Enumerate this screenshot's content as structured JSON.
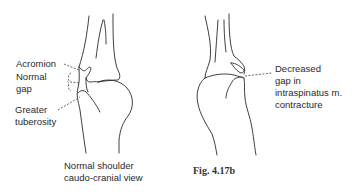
{
  "figure": {
    "left_panel": {
      "labels": {
        "acromion": "Acromion",
        "normal_gap_line1": "Normal",
        "normal_gap_line2": "gap",
        "greater_tuberosity_line1": "Greater",
        "greater_tuberosity_line2": "tuberosity"
      },
      "caption_line1": "Normal shoulder",
      "caption_line2": "caudo-cranial view"
    },
    "right_panel": {
      "labels": {
        "decreased_gap_line1": "Decreased",
        "decreased_gap_line2": "gap in",
        "decreased_gap_line3": "intraspinatus m.",
        "decreased_gap_line4": "contracture"
      }
    },
    "figure_number": "Fig. 4.17b"
  }
}
